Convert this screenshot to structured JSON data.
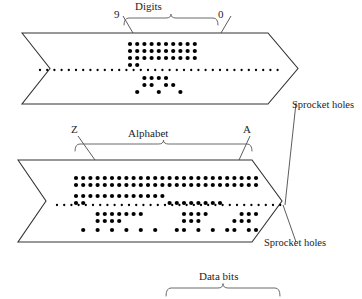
{
  "figure": {
    "title_labels": {
      "digits": "Digits",
      "digits_left_end": "9",
      "digits_right_end": "0",
      "alphabet": "Alphabet",
      "alphabet_left_end": "Z",
      "alphabet_right_end": "A",
      "sprocket_holes_top": "Sprocket holes",
      "sprocket_holes_bottom": "Sprocket holes",
      "data_bits": "Data bits"
    },
    "colors": {
      "ink": "#1a1a1a",
      "hole": "#000000",
      "tape_outline": "#333333",
      "bracket": "#555555",
      "background": "#ffffff"
    },
    "geometry": {
      "hole_radius": 2.1,
      "sprocket_radius": 1.15,
      "column_pitch": 7.2,
      "row_pitch": 7.0
    }
  },
  "chart_data": {
    "type": "punched-tape-diagram",
    "tapes": [
      {
        "name": "digits-tape",
        "label": "Digits",
        "left_end_label": "9",
        "right_end_label": "0",
        "start_x": 130,
        "sprocket_y": 70,
        "columns": 10,
        "rows_above": 3,
        "rows_below": 2,
        "tracks": [
          {
            "track": "above-3",
            "y": 44,
            "pattern": [
              1,
              1,
              1,
              1,
              1,
              1,
              1,
              1,
              1,
              1
            ]
          },
          {
            "track": "above-2",
            "y": 51,
            "pattern": [
              1,
              1,
              1,
              1,
              1,
              1,
              1,
              1,
              1,
              1
            ]
          },
          {
            "track": "above-1",
            "y": 58,
            "pattern": [
              1,
              1,
              1,
              1,
              1,
              1,
              1,
              1,
              1,
              1
            ]
          },
          {
            "track": "above-0",
            "y": 65,
            "pattern": [
              1,
              1,
              0,
              0,
              0,
              0,
              0,
              0,
              0,
              0
            ]
          },
          {
            "track": "below-1",
            "y": 78,
            "pattern": [
              0,
              0,
              1,
              1,
              1,
              1,
              0,
              0,
              0,
              0
            ]
          },
          {
            "track": "below-2",
            "y": 85,
            "pattern": [
              0,
              0,
              1,
              1,
              0,
              1,
              1,
              0,
              0,
              0
            ]
          },
          {
            "track": "below-3",
            "y": 92,
            "pattern": [
              0,
              1,
              0,
              0,
              1,
              0,
              0,
              1,
              0,
              0
            ]
          }
        ]
      },
      {
        "name": "alphabet-tape",
        "label": "Alphabet",
        "left_end_label": "Z",
        "right_end_label": "A",
        "start_x": 76,
        "sprocket_y": 205,
        "columns": 26,
        "tracks": [
          {
            "track": "above-2",
            "y": 178,
            "pattern": [
              1,
              1,
              1,
              1,
              1,
              1,
              1,
              1,
              1,
              1,
              1,
              1,
              1,
              1,
              1,
              1,
              1,
              1,
              1,
              1,
              1,
              1,
              1,
              1,
              1,
              1
            ]
          },
          {
            "track": "above-1",
            "y": 185,
            "pattern": [
              1,
              1,
              1,
              1,
              1,
              1,
              1,
              1,
              1,
              1,
              1,
              1,
              1,
              1,
              1,
              1,
              1,
              1,
              1,
              1,
              1,
              1,
              1,
              1,
              1,
              1
            ]
          },
          {
            "track": "above-0",
            "y": 196,
            "pattern": [
              1,
              1,
              1,
              1,
              1,
              1,
              1,
              1,
              1,
              1,
              1,
              1,
              1,
              0,
              0,
              0,
              0,
              0,
              0,
              0,
              0,
              0,
              0,
              0,
              0,
              0
            ]
          },
          {
            "track": "above-sprocket",
            "y": 203,
            "pattern": [
              1,
              1,
              0,
              0,
              0,
              0,
              0,
              0,
              0,
              0,
              0,
              0,
              0,
              1,
              1,
              1,
              1,
              1,
              1,
              1,
              1,
              0,
              0,
              0,
              0,
              0
            ]
          },
          {
            "track": "below-1",
            "y": 214,
            "pattern": [
              0,
              0,
              0,
              1,
              1,
              1,
              1,
              1,
              1,
              1,
              0,
              0,
              0,
              0,
              0,
              1,
              1,
              1,
              1,
              0,
              0,
              0,
              0,
              1,
              1,
              1
            ]
          },
          {
            "track": "below-2",
            "y": 221,
            "pattern": [
              0,
              0,
              0,
              1,
              1,
              1,
              1,
              0,
              0,
              0,
              0,
              0,
              0,
              0,
              0,
              1,
              1,
              1,
              0,
              0,
              0,
              0,
              1,
              1,
              1,
              0
            ]
          },
          {
            "track": "below-3",
            "y": 230,
            "pattern": [
              0,
              1,
              0,
              1,
              0,
              1,
              0,
              1,
              0,
              1,
              0,
              1,
              0,
              0,
              1,
              1,
              0,
              1,
              0,
              1,
              0,
              1,
              1,
              0,
              1,
              1
            ]
          }
        ]
      }
    ],
    "sprocket_rows": [
      {
        "name": "digits-sprocket-row",
        "y": 70,
        "x_start": 40,
        "x_end": 283,
        "pitch": 7.2
      },
      {
        "name": "alphabet-sprocket-row",
        "y": 205,
        "x_start": 57,
        "x_end": 285,
        "pitch": 7.2
      }
    ]
  }
}
